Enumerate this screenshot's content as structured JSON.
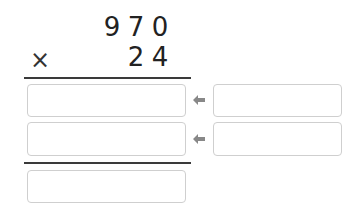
{
  "problem": {
    "multiplicand": [
      "9",
      "7",
      "0"
    ],
    "multiplier": [
      "2",
      "4"
    ],
    "operator": "×"
  },
  "inputs": {
    "partial_1": "",
    "partial_1_helper": "",
    "partial_2": "",
    "partial_2_helper": "",
    "result": ""
  },
  "icons": {
    "arrow": "arrow-left-icon"
  },
  "colors": {
    "digits": "#222222",
    "rule": "#3a3a3a",
    "box_border": "#cfcfcf",
    "arrow": "#888888"
  }
}
